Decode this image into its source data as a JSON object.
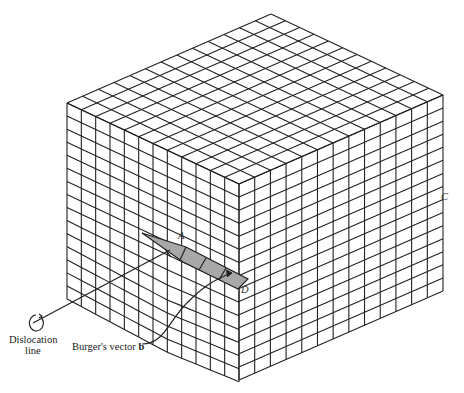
{
  "figure": {
    "labels": {
      "A": "A",
      "C": "C",
      "D": "D",
      "dislocation_line_1": "Dislocation",
      "dislocation_line_2": "line",
      "burgers_prefix": "Burger's vector ",
      "burgers_bold": "b"
    },
    "colors": {
      "line": "#222222",
      "shade": "#a8a8a8",
      "background": "#ffffff"
    },
    "grid": {
      "left_cols": 12,
      "right_cols": 13,
      "rows": 15
    }
  }
}
